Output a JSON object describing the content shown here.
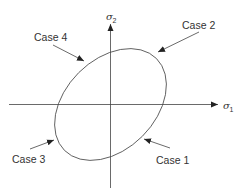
{
  "diagram": {
    "axes": {
      "x_label": "σ",
      "x_label_sub": "1",
      "y_label": "σ",
      "y_label_sub": "2"
    },
    "shape": "tilted ellipse centered at origin",
    "cases": [
      {
        "label": "Case 1",
        "position": "lower-right"
      },
      {
        "label": "Case 2",
        "position": "upper-right"
      },
      {
        "label": "Case 3",
        "position": "lower-left"
      },
      {
        "label": "Case 4",
        "position": "upper-left"
      }
    ],
    "colors": {
      "line": "#333333",
      "background": "#ffffff"
    }
  }
}
